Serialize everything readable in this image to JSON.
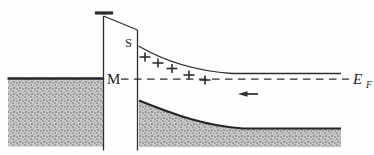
{
  "figure": {
    "type": "energy-band-diagram",
    "colors": {
      "background": "#fdfdfd",
      "line": "#2e2e2e",
      "edge_dark": "#262626",
      "shade_base": "#c7c7c7",
      "shade_dot1": "#a2a2a2",
      "shade_dot2": "#b6b6b6",
      "shade_dot3": "#989898"
    },
    "labels": {
      "metal": "M",
      "semiconductor_surface": "S",
      "fermi_symbol": "E",
      "fermi_subscript": "F"
    },
    "donor_charges": {
      "symbol": "+",
      "count": 5,
      "positions": [
        [
          145,
          57
        ],
        [
          158,
          63
        ],
        [
          172,
          68.5
        ],
        [
          189,
          75
        ],
        [
          205,
          80
        ]
      ]
    },
    "electron_flow": {
      "direction": "left"
    }
  }
}
